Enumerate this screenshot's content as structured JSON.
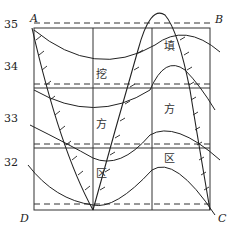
{
  "diagram": {
    "title": "",
    "contour_labels": [
      "35",
      "34",
      "33",
      "32"
    ],
    "corner_labels": {
      "top_left": "A",
      "top_right": "B",
      "bottom_left": "D",
      "bottom_right": "C"
    },
    "region_cut": {
      "chars": [
        "挖",
        "方",
        "区"
      ],
      "meaning": "cut area"
    },
    "region_fill": {
      "chars": [
        "填",
        "方",
        "区"
      ],
      "meaning": "fill area"
    }
  }
}
